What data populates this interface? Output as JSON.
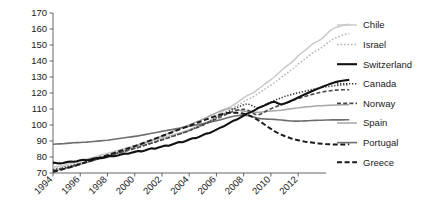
{
  "chart_data": {
    "type": "line",
    "title": "",
    "subtitle": "",
    "xlabel": "",
    "ylabel": "",
    "xlim": [
      1994,
      2013.75
    ],
    "ylim": [
      70,
      170
    ],
    "grid": false,
    "legend_position": "right",
    "y_ticks": [
      70,
      80,
      90,
      100,
      110,
      120,
      130,
      140,
      150,
      160,
      170
    ],
    "x_ticks": [
      1994,
      1996,
      1998,
      2000,
      2002,
      2004,
      2006,
      2008,
      2010,
      2012
    ],
    "x_tick_rotation": -45,
    "x_start": 1994,
    "x_step": 0.25,
    "series": [
      {
        "name": "Chile",
        "color": "#c9c9c9",
        "width": 1.5,
        "dash": "none",
        "values": [
          73.5,
          74.0,
          74.3,
          74.8,
          75.4,
          75.9,
          76.4,
          77.0,
          77.6,
          78.2,
          78.8,
          79.4,
          79.9,
          80.5,
          81.2,
          81.8,
          82.3,
          82.9,
          83.5,
          84.1,
          84.7,
          85.3,
          85.9,
          86.4,
          87.0,
          87.6,
          88.2,
          88.8,
          89.4,
          90.0,
          90.7,
          91.3,
          92.0,
          92.6,
          93.2,
          93.8,
          94.4,
          95.0,
          95.6,
          96.3,
          97.0,
          97.8,
          98.6,
          99.4,
          100.3,
          101.4,
          102.6,
          104.0,
          105.5,
          107.2,
          108.8,
          110.2,
          111.3,
          112.5,
          113.8,
          115.4,
          117.0,
          118.4,
          119.3,
          120.4,
          121.9,
          123.6,
          125.3,
          126.8,
          128.3,
          130.0,
          131.9,
          133.9,
          135.8,
          137.4,
          139.0,
          141.0,
          143.2,
          145.0,
          146.6,
          148.4,
          150.3,
          151.6,
          152.6,
          154.0,
          156.0,
          158.2,
          159.9,
          161.0,
          161.6,
          162.2,
          162.6,
          162.9
        ]
      },
      {
        "name": "Israel",
        "color": "#b5b5b5",
        "width": 1.5,
        "dash": "1.6,1.9",
        "values": [
          72.6,
          73.0,
          73.4,
          73.9,
          74.4,
          74.9,
          75.4,
          76.0,
          76.6,
          77.2,
          77.8,
          78.4,
          79.0,
          79.6,
          80.2,
          80.8,
          81.4,
          82.0,
          82.6,
          83.2,
          83.8,
          84.4,
          85.0,
          85.6,
          86.2,
          86.8,
          87.4,
          88.0,
          88.6,
          89.2,
          89.8,
          90.5,
          91.2,
          91.8,
          92.4,
          93.0,
          93.7,
          94.4,
          95.1,
          95.8,
          96.6,
          97.4,
          98.3,
          99.2,
          100.1,
          101.1,
          102.2,
          103.4,
          104.7,
          106.0,
          107.3,
          108.5,
          109.6,
          110.8,
          112.0,
          113.3,
          114.6,
          115.8,
          116.8,
          117.9,
          119.2,
          120.6,
          122.1,
          123.5,
          124.9,
          126.4,
          128.0,
          129.7,
          131.3,
          132.8,
          134.4,
          136.2,
          138.0,
          139.7,
          141.3,
          143.0,
          144.7,
          146.0,
          147.1,
          148.4,
          150.1,
          151.9,
          153.4,
          154.5,
          155.3,
          156.1,
          156.7,
          157.2
        ]
      },
      {
        "name": "Switzerland",
        "color": "#111111",
        "width": 2.1,
        "dash": "none",
        "values": [
          76.5,
          76.2,
          76.0,
          76.3,
          76.8,
          77.2,
          77.0,
          77.4,
          78.0,
          78.3,
          78.0,
          78.4,
          79.0,
          79.4,
          79.2,
          79.6,
          80.2,
          80.7,
          80.5,
          81.0,
          81.6,
          82.1,
          82.0,
          82.6,
          83.2,
          83.7,
          83.5,
          84.1,
          84.8,
          85.4,
          85.2,
          85.9,
          86.6,
          87.2,
          87.0,
          87.8,
          88.6,
          89.3,
          89.2,
          90.0,
          90.9,
          91.7,
          91.8,
          92.7,
          93.7,
          94.6,
          95.0,
          96.0,
          97.1,
          98.2,
          99.0,
          100.2,
          101.5,
          102.7,
          103.4,
          104.6,
          105.9,
          107.1,
          107.9,
          109.0,
          110.2,
          111.3,
          112.1,
          113.1,
          114.0,
          114.6,
          113.6,
          112.8,
          113.4,
          114.2,
          115.2,
          116.2,
          117.2,
          118.2,
          119.2,
          120.2,
          121.1,
          122.0,
          122.9,
          123.8,
          124.6,
          125.4,
          126.1,
          126.8,
          127.3,
          127.7,
          128.0,
          128.2
        ]
      },
      {
        "name": "Canada",
        "color": "#3a3a3a",
        "width": 1.6,
        "dash": "1.3,1.7",
        "values": [
          72.0,
          72.4,
          72.8,
          73.3,
          73.8,
          74.3,
          74.8,
          75.3,
          75.9,
          76.5,
          77.1,
          77.7,
          78.3,
          78.9,
          79.5,
          80.1,
          80.7,
          81.3,
          81.9,
          82.5,
          83.1,
          83.7,
          84.3,
          84.9,
          85.5,
          86.1,
          86.8,
          87.5,
          88.1,
          88.7,
          89.4,
          90.1,
          90.8,
          91.5,
          92.2,
          92.9,
          93.6,
          94.3,
          95.0,
          95.8,
          96.6,
          97.5,
          98.4,
          99.3,
          100.2,
          101.2,
          102.3,
          103.4,
          104.5,
          105.6,
          106.7,
          107.8,
          108.9,
          110.0,
          110.9,
          111.8,
          112.6,
          113.2,
          112.6,
          111.6,
          110.8,
          111.2,
          112.2,
          113.4,
          114.4,
          115.3,
          116.2,
          117.0,
          117.8,
          118.4,
          119.0,
          119.6,
          120.1,
          120.6,
          121.1,
          121.6,
          122.1,
          122.6,
          123.0,
          123.4,
          123.8,
          124.1,
          124.4,
          124.7,
          124.9,
          125.1,
          125.2,
          125.3
        ]
      },
      {
        "name": "Norway",
        "color": "#4a4a4a",
        "width": 1.6,
        "dash": "4,2.2",
        "values": [
          71.5,
          71.9,
          72.3,
          72.8,
          73.3,
          73.9,
          74.5,
          75.1,
          75.7,
          76.3,
          76.9,
          77.5,
          78.1,
          78.7,
          79.3,
          79.9,
          80.5,
          81.1,
          81.7,
          82.3,
          82.9,
          83.5,
          84.1,
          84.7,
          85.3,
          85.9,
          86.6,
          87.3,
          88.0,
          88.7,
          89.3,
          90.0,
          90.7,
          91.4,
          92.1,
          92.8,
          93.5,
          94.2,
          94.9,
          95.7,
          96.5,
          97.3,
          98.1,
          99.0,
          99.9,
          100.8,
          101.8,
          102.8,
          103.8,
          104.8,
          105.8,
          106.8,
          107.8,
          108.6,
          109.2,
          109.6,
          109.8,
          109.5,
          108.4,
          107.0,
          106.2,
          106.8,
          108.0,
          109.2,
          110.2,
          111.0,
          111.8,
          112.6,
          113.4,
          114.2,
          115.0,
          115.8,
          116.5,
          117.2,
          117.8,
          118.4,
          119.0,
          119.6,
          120.1,
          120.6,
          121.0,
          121.3,
          121.6,
          121.8,
          121.9,
          122.0,
          122.0,
          122.0
        ]
      },
      {
        "name": "Spain",
        "color": "#a6a6a6",
        "width": 1.5,
        "dash": "none",
        "values": [
          71.2,
          71.6,
          72.0,
          72.5,
          73.0,
          73.5,
          74.1,
          74.7,
          75.3,
          75.9,
          76.5,
          77.1,
          77.8,
          78.5,
          79.2,
          79.9,
          80.6,
          81.3,
          82.0,
          82.7,
          83.4,
          84.1,
          84.9,
          85.7,
          86.5,
          87.3,
          88.1,
          88.9,
          89.7,
          90.5,
          91.3,
          92.2,
          93.1,
          94.0,
          94.9,
          95.8,
          96.7,
          97.6,
          98.4,
          99.2,
          100.0,
          100.9,
          101.8,
          102.7,
          103.6,
          104.6,
          105.6,
          106.6,
          107.6,
          108.6,
          109.4,
          110.0,
          110.4,
          110.2,
          109.6,
          109.0,
          108.6,
          108.4,
          108.2,
          108.0,
          107.9,
          108.0,
          108.3,
          108.6,
          108.8,
          108.9,
          109.0,
          109.2,
          109.5,
          109.8,
          110.1,
          110.4,
          110.7,
          111.0,
          111.2,
          111.4,
          111.6,
          111.8,
          112.0,
          112.1,
          112.2,
          112.3,
          112.4,
          112.5,
          112.5,
          112.6,
          112.6,
          112.6
        ]
      },
      {
        "name": "Portugal",
        "color": "#6e6e6e",
        "width": 1.6,
        "dash": "none",
        "values": [
          88.0,
          88.1,
          88.2,
          88.3,
          88.5,
          88.7,
          88.9,
          89.0,
          89.1,
          89.2,
          89.3,
          89.5,
          89.7,
          89.9,
          90.1,
          90.3,
          90.5,
          90.8,
          91.1,
          91.4,
          91.7,
          92.0,
          92.3,
          92.6,
          92.9,
          93.2,
          93.6,
          94.0,
          94.4,
          94.8,
          95.2,
          95.6,
          96.0,
          96.4,
          96.8,
          97.2,
          97.6,
          98.0,
          98.4,
          98.8,
          99.2,
          99.6,
          100.0,
          100.4,
          100.8,
          101.2,
          101.7,
          102.2,
          102.7,
          103.2,
          103.8,
          104.4,
          105.0,
          105.5,
          105.8,
          106.0,
          106.1,
          106.0,
          105.6,
          105.0,
          104.4,
          104.0,
          103.8,
          103.7,
          103.6,
          103.5,
          103.3,
          103.1,
          102.9,
          102.7,
          102.5,
          102.4,
          102.4,
          102.5,
          102.6,
          102.7,
          102.8,
          102.9,
          103.0,
          103.0,
          103.1,
          103.1,
          103.2,
          103.2,
          103.2,
          103.2,
          103.3,
          103.3
        ]
      },
      {
        "name": "Greece",
        "color": "#1a1a1a",
        "width": 2.0,
        "dash": "5,2.6",
        "values": [
          70.8,
          71.3,
          71.8,
          72.4,
          73.0,
          73.6,
          74.2,
          74.9,
          75.6,
          76.3,
          77.0,
          77.7,
          78.4,
          79.1,
          79.8,
          80.5,
          81.2,
          81.9,
          82.6,
          83.3,
          84.0,
          84.7,
          85.4,
          86.1,
          86.8,
          87.5,
          88.3,
          89.1,
          89.9,
          90.7,
          91.5,
          92.3,
          93.1,
          93.9,
          94.7,
          95.5,
          96.3,
          97.1,
          97.9,
          98.7,
          99.5,
          100.3,
          101.1,
          101.9,
          102.7,
          103.5,
          104.3,
          105.1,
          105.8,
          106.4,
          106.9,
          107.3,
          107.6,
          107.7,
          107.6,
          107.4,
          107.0,
          106.4,
          105.6,
          104.6,
          103.4,
          102.0,
          100.5,
          99.0,
          97.6,
          96.2,
          95.0,
          94.0,
          93.1,
          92.3,
          91.6,
          91.0,
          90.5,
          90.0,
          89.6,
          89.3,
          89.0,
          88.7,
          88.5,
          88.3,
          88.1,
          88.0,
          87.9,
          87.8,
          87.8,
          87.8,
          87.9,
          88.0
        ]
      }
    ]
  },
  "legend": {
    "items": [
      {
        "label": "Chile"
      },
      {
        "label": "Israel"
      },
      {
        "label": "Switzerland"
      },
      {
        "label": "Canada"
      },
      {
        "label": "Norway"
      },
      {
        "label": "Spain"
      },
      {
        "label": "Portugal"
      },
      {
        "label": "Greece"
      }
    ]
  }
}
